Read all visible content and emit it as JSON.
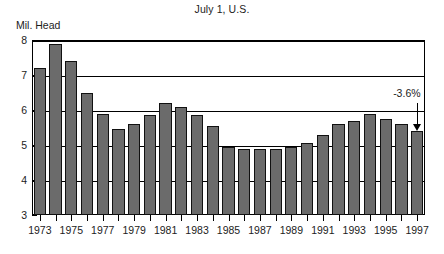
{
  "chart_data": {
    "type": "bar",
    "title": "July 1, U.S.",
    "xlabel": "",
    "ylabel": "Mil. Head",
    "ylim": [
      3,
      8
    ],
    "yticks": [
      3,
      4,
      5,
      6,
      7,
      8
    ],
    "ytick_labels": [
      "3",
      "4",
      "5",
      "6",
      "7",
      "8"
    ],
    "grid": true,
    "legend": "none",
    "categories": [
      "1973",
      "1974",
      "1975",
      "1976",
      "1977",
      "1978",
      "1979",
      "1980",
      "1981",
      "1982",
      "1983",
      "1984",
      "1985",
      "1986",
      "1987",
      "1988",
      "1989",
      "1990",
      "1991",
      "1992",
      "1993",
      "1994",
      "1995",
      "1996",
      "1997"
    ],
    "xtick_labels": [
      "1973",
      "1975",
      "1977",
      "1979",
      "1981",
      "1983",
      "1985",
      "1987",
      "1989",
      "1991",
      "1993",
      "1995",
      "1997"
    ],
    "values": [
      7.2,
      7.9,
      7.4,
      6.5,
      5.9,
      5.45,
      5.6,
      5.85,
      6.2,
      6.1,
      5.85,
      5.55,
      4.95,
      4.9,
      4.9,
      4.9,
      4.95,
      5.05,
      5.3,
      5.6,
      5.7,
      5.9,
      5.75,
      5.6,
      5.4
    ],
    "annotations": [
      {
        "text": "-3.6%",
        "points_to_category": "1997",
        "points_to_value": 5.4
      }
    ],
    "bar_color": "#6b6b6b",
    "bar_edge_color": "#111111",
    "axis_color": "#000000",
    "background_color": "#ffffff"
  }
}
